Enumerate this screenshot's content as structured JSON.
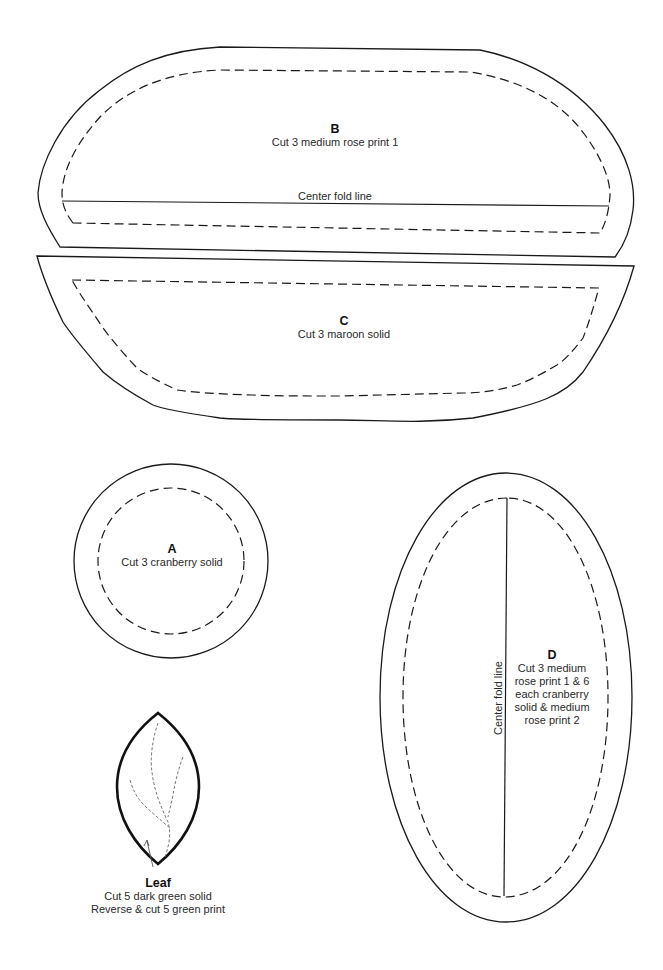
{
  "pieces": {
    "B": {
      "letter": "B",
      "instructions": [
        "Cut 3 medium rose print 1"
      ],
      "fold_label": "Center fold line"
    },
    "C": {
      "letter": "C",
      "instructions": [
        "Cut 3 maroon solid"
      ]
    },
    "A": {
      "letter": "A",
      "instructions": [
        "Cut 3 cranberry solid"
      ]
    },
    "D": {
      "letter": "D",
      "instructions": [
        "Cut 3 medium",
        "rose print 1 & 6",
        "each cranberry",
        "solid & medium",
        "rose print 2"
      ],
      "fold_label": "Center fold line"
    },
    "Leaf": {
      "letter": "Leaf",
      "instructions": [
        "Cut 5 dark green solid",
        "Reverse & cut 5 green print"
      ]
    }
  },
  "legend": {
    "solid_line": "cutting line",
    "dashed_line": "seam line"
  },
  "colors": {
    "line": "#1a1a1a",
    "vein": "#777777",
    "background": "#ffffff"
  }
}
